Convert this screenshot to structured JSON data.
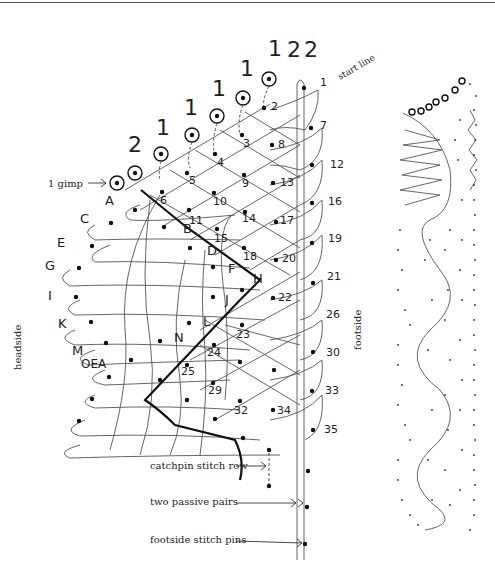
{
  "diagram": {
    "type": "bobbin lace pricking / working diagram",
    "top_counts": [
      "2",
      "1",
      "1",
      "1",
      "1",
      "1",
      "2",
      "2"
    ],
    "labels": {
      "start_line": "start line",
      "gimp": "1 gimp",
      "headside": "headside",
      "footside": "footside",
      "catchpin": "catchpin stitch row",
      "passive": "two passive pairs",
      "footside_pins": "footside stitch pins"
    },
    "letter_pins": [
      "A",
      "B",
      "C",
      "D",
      "E",
      "F",
      "G",
      "H",
      "I",
      "J",
      "K",
      "L",
      "M",
      "N",
      "OEA"
    ],
    "numbered_pins": [
      "1",
      "2",
      "3",
      "4",
      "5",
      "6",
      "7",
      "8",
      "9",
      "10",
      "11",
      "12",
      "13",
      "14",
      "15",
      "16",
      "17",
      "18",
      "19",
      "20",
      "21",
      "22",
      "23",
      "24",
      "25",
      "26",
      "29",
      "30",
      "32",
      "33",
      "34",
      "35"
    ],
    "colors": {
      "ink": "#111111",
      "thread": "#555555",
      "background": "#ffffff"
    }
  }
}
